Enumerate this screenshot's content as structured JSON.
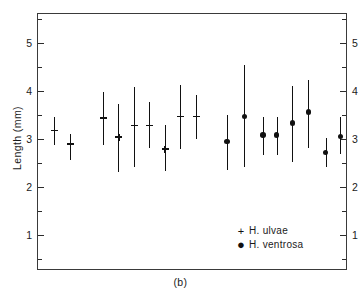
{
  "caption": "(b)",
  "axis": {
    "ylabel": "Length (mm)",
    "major_ticks": [
      1,
      2,
      3,
      4,
      5
    ],
    "major_tick_labels": [
      "1",
      "2",
      "3",
      "4",
      "5"
    ],
    "minor_ticks": [
      0.5,
      1.5,
      2.5,
      3.5,
      4.5,
      5.5
    ],
    "ymin": 0.25,
    "ymax": 5.6
  },
  "legend": {
    "entries": [
      {
        "symbol": "+",
        "symbol_name": "plus-marker",
        "label": "H. ulvae"
      },
      {
        "symbol": "●",
        "symbol_name": "filled-circle-marker",
        "label": "H. ventrosa"
      }
    ]
  },
  "chart_data": {
    "type": "scatter",
    "title": "",
    "subtitle": "",
    "xlabel": "",
    "ylabel": "Length (mm)",
    "xlim": [
      0,
      100
    ],
    "ylim": [
      0.25,
      5.6
    ],
    "grid": false,
    "legend_position": "inside-lower-center",
    "annotations": [
      "(b)"
    ],
    "axis_note": "Mirrored linear y-axis on left and right, labelled 1 to 5 mm with minor ticks at 0.5 intervals; no x-axis ticks or labels.",
    "series": [
      {
        "name": "H. ulvae",
        "marker": "plus",
        "color": "#111111",
        "points": [
          {
            "x": 5.2,
            "y": 3.17,
            "low": 2.88,
            "high": 3.45
          },
          {
            "x": 10.3,
            "y": 2.89,
            "low": 2.56,
            "high": 3.1
          },
          {
            "x": 21.0,
            "y": 3.43,
            "low": 2.87,
            "high": 3.97
          },
          {
            "x": 25.9,
            "y": 3.04,
            "low": 2.31,
            "high": 3.73
          },
          {
            "x": 31.0,
            "y": 3.28,
            "low": 2.41,
            "high": 4.09
          },
          {
            "x": 35.8,
            "y": 3.28,
            "low": 2.81,
            "high": 3.77
          },
          {
            "x": 40.8,
            "y": 2.79,
            "low": 2.34,
            "high": 3.28
          },
          {
            "x": 45.8,
            "y": 3.47,
            "low": 2.78,
            "high": 4.13
          },
          {
            "x": 51.0,
            "y": 3.47,
            "low": 3.0,
            "high": 3.92
          }
        ]
      },
      {
        "name": "H. ventrosa",
        "marker": "circle",
        "color": "#111111",
        "points": [
          {
            "x": 61.0,
            "y": 2.94,
            "low": 2.36,
            "high": 3.5
          },
          {
            "x": 66.5,
            "y": 3.46,
            "low": 2.41,
            "high": 4.53
          },
          {
            "x": 72.5,
            "y": 3.08,
            "low": 2.66,
            "high": 3.45
          },
          {
            "x": 77.0,
            "y": 3.08,
            "low": 2.66,
            "high": 3.45
          },
          {
            "x": 82.0,
            "y": 3.33,
            "low": 2.51,
            "high": 4.1
          },
          {
            "x": 87.2,
            "y": 3.56,
            "low": 2.8,
            "high": 4.23
          },
          {
            "x": 92.8,
            "y": 2.72,
            "low": 2.41,
            "high": 3.02
          },
          {
            "x": 97.5,
            "y": 3.05,
            "low": 2.68,
            "high": 3.45
          }
        ]
      }
    ]
  }
}
